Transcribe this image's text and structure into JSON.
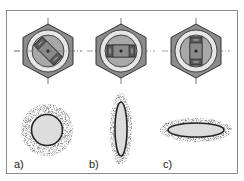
{
  "figure": {
    "panels": [
      {
        "id": "a",
        "label": "a)",
        "rotation_deg": 45,
        "deformation": "circle"
      },
      {
        "id": "b",
        "label": "b)",
        "rotation_deg": 0,
        "deformation": "vertical-ellipse"
      },
      {
        "id": "c",
        "label": "c)",
        "rotation_deg": 90,
        "deformation": "horizontal-ellipse"
      }
    ]
  },
  "colors": {
    "hex_fill": "#8c8c8c",
    "washer_fill": "#e6e6e6",
    "inner_fill": "#a8a8a8",
    "slot_fill": "#5a5a5a",
    "ellipse_fill": "#dcdcdc",
    "outline": "#222222",
    "frame": "#8a8a8a"
  }
}
